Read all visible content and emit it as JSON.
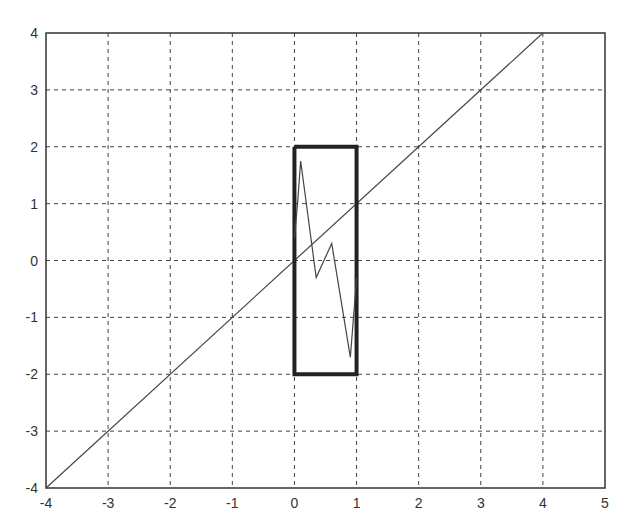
{
  "chart_data": {
    "type": "line",
    "title": "",
    "xlabel": "",
    "ylabel": "",
    "xlim": [
      -4,
      5
    ],
    "ylim": [
      -4,
      4
    ],
    "grid": true,
    "x_ticks": [
      "-4",
      "-3",
      "-2",
      "-1",
      "0",
      "1",
      "2",
      "3",
      "4",
      "5"
    ],
    "y_ticks": [
      "4",
      "3",
      "2",
      "1",
      "0",
      "-1",
      "-2",
      "-3",
      "-4"
    ],
    "series": [
      {
        "name": "diagonal line",
        "style": "thin solid",
        "x": [
          -4,
          4
        ],
        "y": [
          -4,
          4
        ]
      },
      {
        "name": "rectangle",
        "style": "thick solid",
        "x": [
          0,
          1,
          1,
          0,
          0
        ],
        "y": [
          2,
          2,
          -2,
          -2,
          2
        ]
      },
      {
        "name": "zigzag",
        "style": "thin solid",
        "x": [
          0,
          0.05,
          0.1,
          0.35,
          0.6,
          0.9,
          0.98,
          1.0
        ],
        "y": [
          0.4,
          1.0,
          1.75,
          -0.3,
          0.3,
          -1.7,
          -0.6,
          -0.3
        ]
      }
    ]
  }
}
